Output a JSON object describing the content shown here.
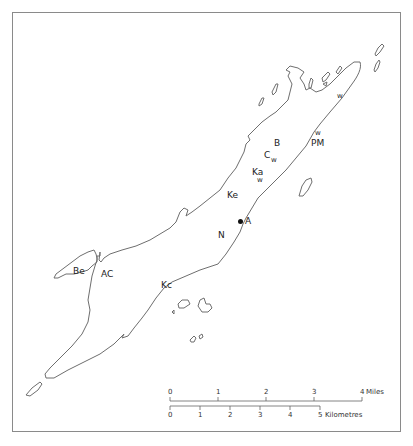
{
  "map": {
    "labels": {
      "w_ne": "w",
      "w_pm": "w",
      "pm": "PM",
      "b": "B",
      "c": "C",
      "c_w": "w",
      "ka": "Ka",
      "ka_w": "w",
      "ke": "Ke",
      "a": "A",
      "n": "N",
      "be": "Be",
      "ac": "AC",
      "kc": "Kc"
    },
    "stroke_color": "#6e6e6e",
    "frame_color": "#8a8a8a"
  },
  "scale_bar": {
    "miles": {
      "ticks": [
        "0",
        "1",
        "2",
        "3",
        "4"
      ],
      "unit": "Miles"
    },
    "kilometres": {
      "ticks": [
        "0",
        "1",
        "2",
        "3",
        "4",
        "5"
      ],
      "unit": "Kilometres"
    }
  }
}
